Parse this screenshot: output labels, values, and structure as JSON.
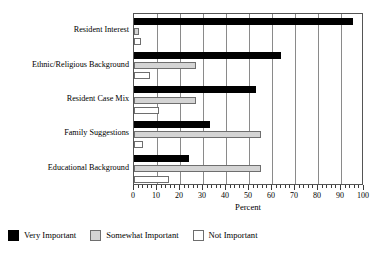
{
  "chart_data": {
    "type": "bar",
    "orientation": "horizontal",
    "title": "",
    "xlabel": "Percent",
    "ylabel": "",
    "xlim": [
      0,
      100
    ],
    "grid": true,
    "grid_axis": "x",
    "legend_position": "bottom-left",
    "categories": [
      "Resident Interest",
      "Ethnic/Religious Background",
      "Resident Case Mix",
      "Family Suggestions",
      "Educational Background"
    ],
    "series": [
      {
        "name": "Very Important",
        "color": "#000000",
        "values": [
          95,
          64,
          53,
          33,
          24
        ]
      },
      {
        "name": "Somewhat Important",
        "color": "#d4d4d4",
        "values": [
          2,
          27,
          27,
          55,
          55
        ]
      },
      {
        "name": "Not Important",
        "color": "#ffffff",
        "values": [
          3,
          7,
          11,
          4,
          15
        ]
      }
    ],
    "xticks": [
      0,
      10,
      20,
      30,
      40,
      50,
      60,
      70,
      80,
      90,
      100
    ],
    "xtick_labels": [
      "0",
      "10",
      "20",
      "30",
      "40",
      "50",
      "60",
      "70",
      "80",
      "90",
      "100"
    ],
    "minor_tick_step": 2
  },
  "axis": {
    "x_title": "Percent"
  },
  "legend": {
    "items": [
      {
        "label": "Very Important",
        "swatch": "black-square-icon"
      },
      {
        "label": "Somewhat Important",
        "swatch": "gray-square-icon"
      },
      {
        "label": "Not Important",
        "swatch": "white-square-icon"
      }
    ]
  }
}
